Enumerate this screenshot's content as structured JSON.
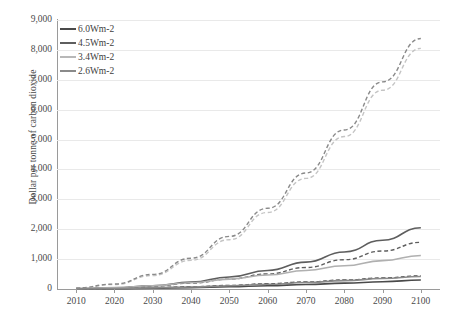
{
  "chart_data": {
    "type": "line",
    "title": "",
    "xlabel": "",
    "ylabel": "Dollar per tonne of carbon dioxide",
    "xlim": [
      2005,
      2105
    ],
    "ylim": [
      0,
      9000
    ],
    "grid": true,
    "legend_position": "top-left",
    "x_ticks": [
      "2010",
      "2020",
      "2030",
      "2040",
      "2050",
      "2060",
      "2070",
      "2080",
      "2090",
      "2100"
    ],
    "y_ticks": [
      "0",
      "1,000",
      "2,000",
      "3,000",
      "4,000",
      "5,000",
      "6,000",
      "7,000",
      "8,000",
      "9,000"
    ],
    "x": [
      2010,
      2020,
      2030,
      2040,
      2050,
      2060,
      2070,
      2080,
      2090,
      2100
    ],
    "series": [
      {
        "name": "6.0Wm-2",
        "style": "solid",
        "color": "#4a4a4a",
        "values": [
          5,
          12,
          25,
          45,
          75,
          110,
          150,
          195,
          245,
          300
        ]
      },
      {
        "name": "6.0Wm-2 dashed",
        "style": "dashed",
        "color": "#4a4a4a",
        "values": [
          8,
          20,
          42,
          75,
          120,
          175,
          235,
          300,
          370,
          440
        ]
      },
      {
        "name": "4.5Wm-2",
        "style": "solid",
        "color": "#5e5e5e",
        "values": [
          10,
          40,
          110,
          230,
          400,
          620,
          900,
          1240,
          1630,
          2050
        ]
      },
      {
        "name": "4.5Wm-2 dashed",
        "style": "dashed",
        "color": "#5e5e5e",
        "values": [
          10,
          35,
          95,
          195,
          330,
          505,
          720,
          980,
          1270,
          1560
        ]
      },
      {
        "name": "3.4Wm-2",
        "style": "solid",
        "color": "#b0b0b0",
        "values": [
          12,
          45,
          110,
          210,
          330,
          470,
          620,
          780,
          950,
          1120
        ]
      },
      {
        "name": "3.4Wm-2 dashed",
        "style": "dashed",
        "color": "#c4c4c4",
        "values": [
          30,
          150,
          450,
          960,
          1650,
          2560,
          3700,
          5100,
          6650,
          8050
        ]
      },
      {
        "name": "2.6Wm-2",
        "style": "solid",
        "color": "#8a8a8a",
        "values": [
          6,
          18,
          38,
          68,
          108,
          158,
          215,
          280,
          350,
          420
        ]
      },
      {
        "name": "2.6Wm-2 dashed",
        "style": "dashed",
        "color": "#8a8a8a",
        "values": [
          35,
          165,
          490,
          1030,
          1760,
          2700,
          3880,
          5320,
          6930,
          8380
        ]
      }
    ]
  },
  "legend": {
    "items": [
      {
        "label": "6.0Wm-2",
        "color": "#4a4a4a"
      },
      {
        "label": "4.5Wm-2",
        "color": "#5e5e5e"
      },
      {
        "label": "3.4Wm-2",
        "color": "#b8b8b8"
      },
      {
        "label": "2.6Wm-2",
        "color": "#8a8a8a"
      }
    ]
  }
}
